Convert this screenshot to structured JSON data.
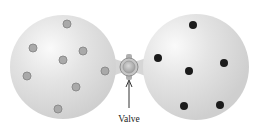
{
  "diagram": {
    "valve_label": "Valve",
    "colors": {
      "bulb_fill": "#dcdcdc",
      "bulb_highlight": "#f7f7f7",
      "gray_particle": "#a8a8a8",
      "gray_particle_stroke": "#8a8a8a",
      "black_particle": "#1a1a1a",
      "valve": "#b9b9b9"
    },
    "left_bulb": {
      "particle_type": "gray",
      "particle_count": 8
    },
    "right_bulb": {
      "particle_type": "black",
      "particle_count": 6
    }
  }
}
